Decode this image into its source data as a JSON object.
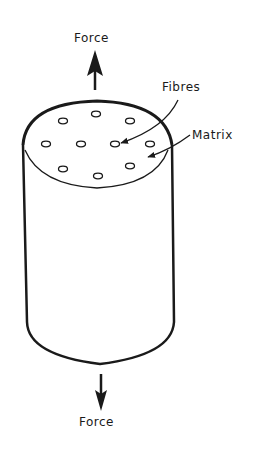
{
  "diagram": {
    "type": "fibre-reinforced composite cylinder under tension",
    "labels": {
      "force_top": "Force",
      "force_bottom": "Force",
      "fibres": "Fibres",
      "matrix": "Matrix"
    },
    "colors": {
      "ink": "#1a1a1a",
      "background": "#ffffff"
    },
    "fibre_count": 10
  }
}
